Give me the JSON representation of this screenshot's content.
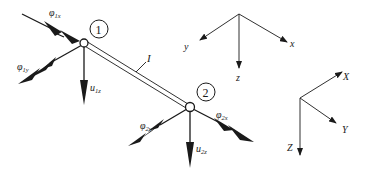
{
  "figure": {
    "element_label": "I",
    "nodes": [
      {
        "id": "1",
        "label": "1"
      },
      {
        "id": "2",
        "label": "2"
      }
    ],
    "dofs": {
      "phi_1x": {
        "base": "φ",
        "sub": "1x"
      },
      "phi_1y": {
        "base": "φ",
        "sub": "1y"
      },
      "u_1z": {
        "base": "u",
        "sub": "1z"
      },
      "phi_2x": {
        "base": "φ",
        "sub": "2x"
      },
      "phi_2y": {
        "base": "φ",
        "sub": "2y"
      },
      "u_2z": {
        "base": "u",
        "sub": "2z"
      }
    },
    "local_axes": {
      "x": "x",
      "y": "y",
      "z": "z"
    },
    "global_axes": {
      "X": "X",
      "Y": "Y",
      "Z": "Z"
    }
  }
}
